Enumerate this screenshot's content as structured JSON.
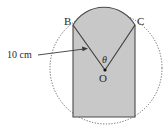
{
  "diagram": {
    "points": {
      "B": "B",
      "C": "C",
      "O": "O"
    },
    "angle_label": "θ",
    "length_label": "10 cm",
    "colors": {
      "fill": "#c8c8c8",
      "stroke": "#4a4a4a",
      "dashed_circle": "#555555"
    }
  }
}
